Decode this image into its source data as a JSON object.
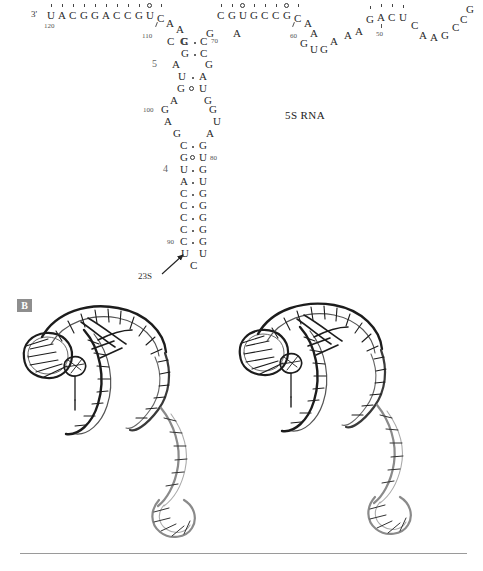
{
  "figure": {
    "molecule_label": "5S RNA",
    "connector_label": "23S",
    "panel_b_tag": "B",
    "five_prime_mark": "3'"
  },
  "secondary_structure": {
    "type": "rna-secondary-structure",
    "helix_labels": [
      {
        "id": "helix-5",
        "label": "5"
      },
      {
        "id": "helix-4",
        "label": "4"
      }
    ],
    "position_numbers": [
      "120",
      "110",
      "70",
      "60",
      "50",
      "100",
      "80",
      "90"
    ],
    "top_left_strand": {
      "label": "top-left-strand",
      "bases": [
        "U",
        "A",
        "C",
        "G",
        "G",
        "A",
        "C",
        "C",
        "G",
        "U",
        "C"
      ],
      "markers": [
        "tick",
        "tick",
        "tick",
        "tick",
        "tick",
        "tick",
        "tick",
        "tick",
        "tick",
        "circle",
        "tick"
      ]
    },
    "top_middle_strand": {
      "label": "top-middle-strand",
      "bases": [
        "C",
        "G",
        "U",
        "G",
        "C",
        "C",
        "G",
        "C"
      ],
      "markers": [
        "tick",
        "tick",
        "circle",
        "tick",
        "tick",
        "tick",
        "circle",
        "tick"
      ]
    },
    "top_right_strand": {
      "label": "top-right-strand",
      "bases": [
        "G",
        "A",
        "C",
        "U"
      ],
      "markers": [
        "tick",
        "tick",
        "tick",
        "tick"
      ]
    },
    "left_loop_bases": [
      "A",
      "A",
      "C",
      "G"
    ],
    "center_loop_bases": [
      "G",
      "A"
    ],
    "right_loop_bases": [
      "A",
      "A",
      "G",
      "U",
      "G",
      "A",
      "A"
    ],
    "far_right_bases": [
      "C",
      "A",
      "A",
      "G",
      "C",
      "C",
      "G"
    ],
    "stem": {
      "label": "central-stem",
      "rows": [
        {
          "left": "C",
          "pair": "dot",
          "right": "C"
        },
        {
          "left": "G",
          "pair": "dot",
          "right": "C"
        },
        {
          "left": "A",
          "pair": "none",
          "right": "G"
        },
        {
          "left": "U",
          "pair": "dot",
          "right": "A"
        },
        {
          "left": "G",
          "pair": "wobble",
          "right": "U"
        },
        {
          "left": "A",
          "pair": "none",
          "right": "G"
        },
        {
          "left": "G",
          "pair": "none",
          "right": "G"
        },
        {
          "left": "A",
          "pair": "none",
          "right": "U"
        },
        {
          "left": "G",
          "pair": "none",
          "right": "A"
        },
        {
          "left": "C",
          "pair": "dot",
          "right": "G"
        },
        {
          "left": "G",
          "pair": "wobble",
          "right": "U"
        },
        {
          "left": "U",
          "pair": "dot",
          "right": "G"
        },
        {
          "left": "A",
          "pair": "dot",
          "right": "U"
        },
        {
          "left": "C",
          "pair": "dot",
          "right": "G"
        },
        {
          "left": "C",
          "pair": "dot",
          "right": "G"
        },
        {
          "left": "C",
          "pair": "dot",
          "right": "G"
        },
        {
          "left": "C",
          "pair": "dot",
          "right": "G"
        },
        {
          "left": "C",
          "pair": "dot",
          "right": "G"
        },
        {
          "left": "U",
          "pair": "none",
          "right": "U"
        }
      ],
      "terminal_base": "C"
    }
  },
  "panel_b": {
    "caption_tag": "B",
    "description": "stereo-pair-rna-tertiary-structure",
    "views": [
      "left-stereo-view",
      "right-stereo-view"
    ]
  }
}
